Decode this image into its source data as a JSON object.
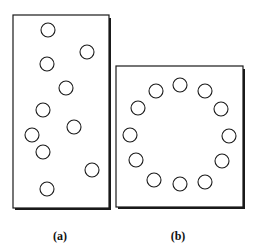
{
  "figure": {
    "panels": [
      {
        "id": "a",
        "label": "(a)",
        "label_pos": [
          60,
          240
        ],
        "box": {
          "x": 13,
          "y": 15,
          "w": 96,
          "h": 193
        },
        "arrangement": "random",
        "circle_radius": 7,
        "circles": [
          [
            48,
            30
          ],
          [
            87,
            52
          ],
          [
            47,
            64
          ],
          [
            66,
            88
          ],
          [
            43,
            110
          ],
          [
            74,
            127
          ],
          [
            32,
            135
          ],
          [
            43,
            152
          ],
          [
            92,
            170
          ],
          [
            47,
            189
          ]
        ]
      },
      {
        "id": "b",
        "label": "(b)",
        "label_pos": [
          178,
          240
        ],
        "box": {
          "x": 116,
          "y": 66,
          "w": 127,
          "h": 141
        },
        "arrangement": "ring",
        "circle_radius": 7,
        "circles": [
          [
            180,
            85
          ],
          [
            156,
            91
          ],
          [
            205,
            91
          ],
          [
            138,
            108
          ],
          [
            221,
            109
          ],
          [
            130,
            135
          ],
          [
            229,
            136
          ],
          [
            136,
            160
          ],
          [
            222,
            161
          ],
          [
            154,
            180
          ],
          [
            180,
            184
          ],
          [
            205,
            182
          ]
        ]
      }
    ],
    "colors": {
      "stroke": "#1a1a1a",
      "background": "#ffffff"
    }
  }
}
